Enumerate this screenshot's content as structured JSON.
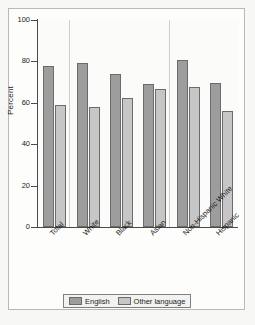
{
  "chart_data": {
    "type": "bar",
    "title": "",
    "subtitle": "",
    "xlabel": "",
    "ylabel": "Percent",
    "ylim": [
      0,
      100
    ],
    "yticks": [
      0,
      20,
      40,
      60,
      80,
      100
    ],
    "ytick_labels": [
      "0",
      "20",
      "40",
      "60",
      "80",
      "100"
    ],
    "grid": false,
    "legend_position": "bottom",
    "categories": [
      "Total",
      "White",
      "Black",
      "Asian",
      "Non-Hispanic White",
      "Hispanic"
    ],
    "series": [
      {
        "name": "English",
        "color": "#9d9d9d",
        "values": [
          78,
          79,
          74,
          69,
          80.5,
          69.5
        ]
      },
      {
        "name": "Other language",
        "color": "#c6c6c6",
        "values": [
          59,
          58,
          62.5,
          66.5,
          67.5,
          56
        ]
      }
    ],
    "separators_after": [
      "Total",
      "Asian"
    ],
    "annotations": []
  },
  "legend": {
    "entries": [
      {
        "label": "English"
      },
      {
        "label": "Other language"
      }
    ]
  },
  "colors": {
    "series_english": "#9d9d9d",
    "series_other_language": "#c6c6c6",
    "axis": "#4a4a4a",
    "bar_outline": "#6b6b6b",
    "separator": "#cfcfcf",
    "frame": "#b9b9b9",
    "text": "#1c1c1c"
  }
}
